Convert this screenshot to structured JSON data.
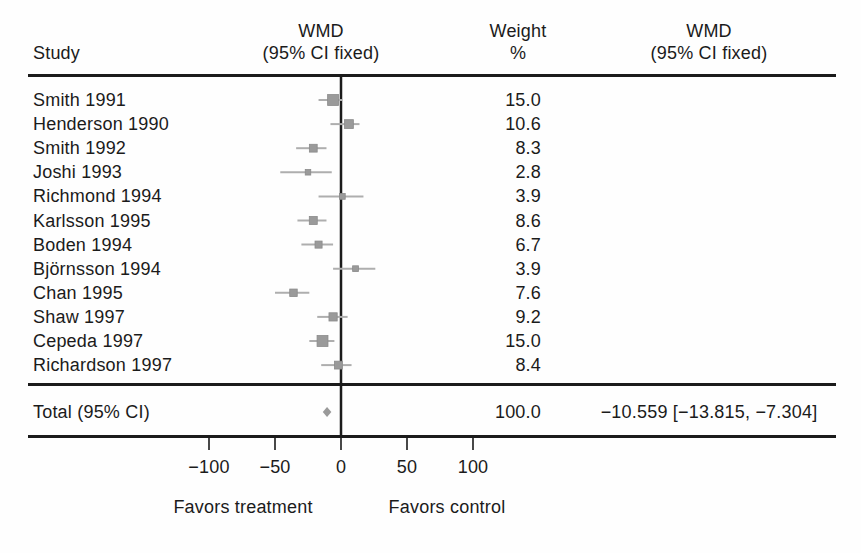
{
  "header": {
    "study": "Study",
    "wmd_line1": "WMD",
    "wmd_line2": "(95% CI fixed)",
    "weight_line1": "Weight",
    "weight_line2": "%"
  },
  "colors": {
    "line": "#1b1b1b",
    "text": "#1b1b1b",
    "marker": "#9a9a9a",
    "ci_line": "#aeaeae",
    "background": "#fefefe"
  },
  "chart_data": {
    "type": "forest",
    "title": "",
    "x_axis": {
      "min": -100,
      "max": 100,
      "ticks": [
        -100,
        -50,
        0,
        50,
        100
      ],
      "zero_line": 0,
      "favors_left": "Favors treatment",
      "favors_right": "Favors control"
    },
    "studies": [
      {
        "name": "Smith 1991",
        "weight": 15.0,
        "wmd": -6,
        "ci_low": -17,
        "ci_high": 1
      },
      {
        "name": "Henderson 1990",
        "weight": 10.6,
        "wmd": 6,
        "ci_low": -8,
        "ci_high": 14
      },
      {
        "name": "Smith 1992",
        "weight": 8.3,
        "wmd": -21,
        "ci_low": -34,
        "ci_high": -11
      },
      {
        "name": "Joshi 1993",
        "weight": 2.8,
        "wmd": -25,
        "ci_low": -46,
        "ci_high": -7
      },
      {
        "name": "Richmond 1994",
        "weight": 3.9,
        "wmd": 1,
        "ci_low": -17,
        "ci_high": 17
      },
      {
        "name": "Karlsson 1995",
        "weight": 8.6,
        "wmd": -21,
        "ci_low": -33,
        "ci_high": -11
      },
      {
        "name": "Boden 1994",
        "weight": 6.7,
        "wmd": -17,
        "ci_low": -30,
        "ci_high": -6
      },
      {
        "name": "Björnsson 1994",
        "weight": 3.9,
        "wmd": 11,
        "ci_low": -6,
        "ci_high": 26
      },
      {
        "name": "Chan 1995",
        "weight": 7.6,
        "wmd": -36,
        "ci_low": -50,
        "ci_high": -24
      },
      {
        "name": "Shaw 1997",
        "weight": 9.2,
        "wmd": -6,
        "ci_low": -18,
        "ci_high": 5
      },
      {
        "name": "Cepeda 1997",
        "weight": 15.0,
        "wmd": -14,
        "ci_low": -24,
        "ci_high": -5
      },
      {
        "name": "Richardson 1997",
        "weight": 8.4,
        "wmd": -2,
        "ci_low": -15,
        "ci_high": 8
      }
    ],
    "total": {
      "label": "Total (95% CI)",
      "weight": "100.0",
      "wmd": -10.559,
      "ci_low": -13.815,
      "ci_high": -7.304,
      "ci_text": "−10.559 [−13.815, −7.304]"
    }
  }
}
